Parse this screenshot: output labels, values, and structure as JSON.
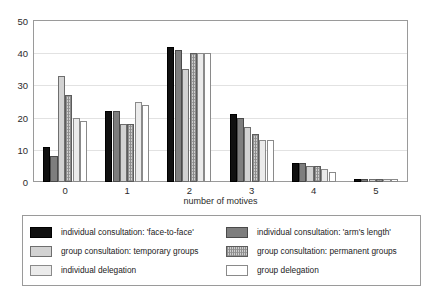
{
  "top_caption": "",
  "chart_data": {
    "type": "bar",
    "title": "",
    "xlabel": "number of motives",
    "ylabel": "",
    "ylim": [
      0,
      50
    ],
    "yticks": [
      "0",
      "10",
      "20",
      "30",
      "40",
      "50"
    ],
    "grid": true,
    "legend_position": "bottom",
    "categories": [
      "0",
      "1",
      "2",
      "3",
      "4",
      "5"
    ],
    "series": [
      {
        "name": "individual consultation: 'face-to-face'",
        "values": [
          11,
          22,
          42,
          21,
          6,
          1
        ]
      },
      {
        "name": "individual consultation: 'arm's length'",
        "values": [
          8,
          22,
          41,
          20,
          6,
          1
        ]
      },
      {
        "name": "group consultation: temporary groups",
        "values": [
          33,
          18,
          35,
          17,
          5,
          1
        ]
      },
      {
        "name": "group consultation: permanent groups",
        "values": [
          27,
          18,
          40,
          15,
          5,
          1
        ]
      },
      {
        "name": "individual delegation",
        "values": [
          20,
          25,
          40,
          13,
          4,
          1
        ]
      },
      {
        "name": "group delegation",
        "values": [
          19,
          24,
          40,
          13,
          3,
          1
        ]
      }
    ]
  },
  "legend": {
    "left_column": [
      {
        "label": "individual consultation: 'face-to-face'",
        "swatch": "series-0-swatch"
      },
      {
        "label": "group consultation: temporary groups",
        "swatch": "series-2-swatch"
      },
      {
        "label": "individual delegation",
        "swatch": "series-4-swatch"
      }
    ],
    "right_column": [
      {
        "label": "individual consultation: 'arm's length'",
        "swatch": "series-1-swatch"
      },
      {
        "label": "group consultation: permanent groups",
        "swatch": "series-3-swatch"
      },
      {
        "label": "group delegation",
        "swatch": "series-5-swatch"
      }
    ]
  },
  "colors": {
    "series_0": "#101010",
    "series_1": "#7e7e7e",
    "series_2": "#d2d2d2",
    "series_3": "#cfcfcf",
    "series_4": "#ebebeb",
    "series_5": "#ffffff",
    "axis": "#9a9a9a",
    "grid": "#e2e2e2",
    "text": "#2b2b2b"
  }
}
